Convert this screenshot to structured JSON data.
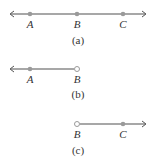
{
  "diagrams": [
    {
      "id": "a",
      "caption": "(a)",
      "type": "line",
      "points": [
        {
          "label": "A",
          "x": 30,
          "style": "filled"
        },
        {
          "label": "B",
          "x": 77,
          "style": "filled"
        },
        {
          "label": "C",
          "x": 123,
          "style": "filled"
        }
      ]
    },
    {
      "id": "b",
      "caption": "(b)",
      "type": "ray-left",
      "points": [
        {
          "label": "A",
          "x": 30,
          "style": "filled"
        },
        {
          "label": "B",
          "x": 77,
          "style": "open"
        }
      ]
    },
    {
      "id": "c",
      "caption": "(c)",
      "type": "ray-right",
      "points": [
        {
          "label": "B",
          "x": 77,
          "style": "open"
        },
        {
          "label": "C",
          "x": 123,
          "style": "filled"
        }
      ]
    }
  ],
  "colors": {
    "line": "#8a8a8a",
    "point": "#9a9a9a",
    "text": "#333333"
  }
}
